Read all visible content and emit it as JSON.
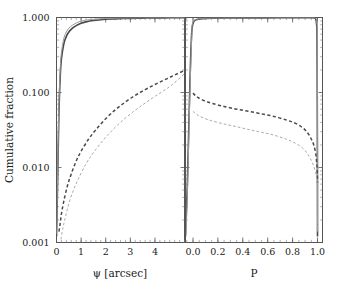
{
  "chart_data": {
    "type": "line",
    "title": "",
    "ylabel": "Cumulative fraction",
    "ylim": [
      0.001,
      1.0
    ],
    "yscale": "log",
    "ytick_labels": [
      "1.000",
      "0.100",
      "0.010",
      "0.001"
    ],
    "ytick_values": [
      1.0,
      0.1,
      0.01,
      0.001
    ],
    "grid": false,
    "legend": "none",
    "panels": [
      {
        "name": "left-panel",
        "xlabel": "ψ [arcsec]",
        "xlim": [
          0,
          5.2
        ],
        "xtick_labels": [
          "0",
          "1",
          "2",
          "3",
          "4"
        ],
        "xtick_values": [
          0,
          1,
          2,
          3,
          4
        ],
        "series": [
          {
            "name": "solid-dark",
            "style": "solid",
            "color": "#4a4a4a",
            "x": [
              0.0,
              0.03,
              0.06,
              0.1,
              0.15,
              0.2,
              0.3,
              0.4,
              0.5,
              0.65,
              0.8,
              1.0,
              1.2,
              1.5,
              1.8,
              2.2,
              2.6,
              3.0,
              3.5,
              4.0,
              4.6,
              5.2
            ],
            "y": [
              0.0012,
              0.0035,
              0.012,
              0.055,
              0.16,
              0.28,
              0.45,
              0.56,
              0.64,
              0.72,
              0.78,
              0.84,
              0.875,
              0.912,
              0.935,
              0.955,
              0.966,
              0.974,
              0.981,
              0.986,
              0.991,
              0.994
            ]
          },
          {
            "name": "solid-light",
            "style": "solid",
            "color": "#9a9a9a",
            "x": [
              0.0,
              0.03,
              0.06,
              0.1,
              0.15,
              0.2,
              0.3,
              0.4,
              0.5,
              0.65,
              0.8,
              1.0,
              1.2,
              1.5,
              1.8,
              2.2,
              2.6,
              3.0,
              3.5,
              4.0,
              4.6,
              5.2
            ],
            "y": [
              0.0013,
              0.0042,
              0.016,
              0.072,
              0.2,
              0.34,
              0.53,
              0.64,
              0.72,
              0.79,
              0.845,
              0.895,
              0.922,
              0.948,
              0.963,
              0.975,
              0.982,
              0.986,
              0.99,
              0.993,
              0.996,
              0.997
            ]
          },
          {
            "name": "dashed-dark",
            "style": "dashed",
            "color": "#4a4a4a",
            "x": [
              0.1,
              0.15,
              0.2,
              0.3,
              0.45,
              0.6,
              0.8,
              1.0,
              1.3,
              1.6,
              2.0,
              2.4,
              2.8,
              3.2,
              3.6,
              4.0,
              4.4,
              4.8,
              5.2
            ],
            "y": [
              0.0014,
              0.0018,
              0.0024,
              0.0036,
              0.0058,
              0.0082,
              0.0122,
              0.0165,
              0.0238,
              0.0318,
              0.0448,
              0.0592,
              0.0748,
              0.0915,
              0.109,
              0.128,
              0.148,
              0.171,
              0.197
            ]
          },
          {
            "name": "dashed-light",
            "style": "dashed",
            "color": "#a8a8a8",
            "x": [
              0.18,
              0.25,
              0.35,
              0.5,
              0.7,
              0.9,
              1.2,
              1.5,
              1.9,
              2.3,
              2.7,
              3.1,
              3.5,
              3.9,
              4.3,
              4.7,
              5.2
            ],
            "y": [
              0.0011,
              0.0015,
              0.0021,
              0.0033,
              0.0051,
              0.0072,
              0.0112,
              0.0158,
              0.0232,
              0.0322,
              0.0428,
              0.0548,
              0.0685,
              0.0845,
              0.103,
              0.127,
              0.178
            ]
          }
        ]
      },
      {
        "name": "right-panel",
        "xlabel": "P",
        "xlim": [
          -0.06,
          1.04
        ],
        "xtick_labels": [
          "0.0",
          "0.2",
          "0.4",
          "0.6",
          "0.8",
          "1.0"
        ],
        "xtick_values": [
          0.0,
          0.2,
          0.4,
          0.6,
          0.8,
          1.0
        ],
        "series": [
          {
            "name": "solid-dark",
            "style": "solid",
            "color": "#4a4a4a",
            "x": [
              -0.06,
              -0.045,
              -0.03,
              -0.015,
              0.0,
              0.05,
              0.15,
              0.3,
              0.5,
              0.7,
              0.85,
              0.93,
              0.96,
              0.975,
              0.985,
              0.992,
              0.996,
              0.999,
              1.0
            ],
            "y": [
              0.0012,
              0.006,
              0.06,
              0.42,
              0.83,
              0.952,
              0.976,
              0.984,
              0.988,
              0.991,
              0.993,
              0.994,
              0.992,
              0.985,
              0.955,
              0.82,
              0.5,
              0.02,
              0.0012
            ]
          },
          {
            "name": "solid-light",
            "style": "solid",
            "color": "#9a9a9a",
            "x": [
              -0.055,
              -0.04,
              -0.025,
              -0.01,
              0.0,
              0.05,
              0.15,
              0.3,
              0.5,
              0.7,
              0.85,
              0.93,
              0.965,
              0.98,
              0.99,
              0.995,
              0.998,
              1.0
            ],
            "y": [
              0.0013,
              0.009,
              0.09,
              0.54,
              0.87,
              0.962,
              0.981,
              0.988,
              0.991,
              0.994,
              0.996,
              0.997,
              0.996,
              0.99,
              0.96,
              0.85,
              0.45,
              0.0014
            ]
          },
          {
            "name": "dashed-dark",
            "style": "dashed",
            "color": "#4a4a4a",
            "x": [
              0.0,
              0.03,
              0.08,
              0.15,
              0.25,
              0.35,
              0.45,
              0.55,
              0.65,
              0.75,
              0.82,
              0.88,
              0.92,
              0.95,
              0.97,
              0.985,
              0.993,
              0.997,
              1.0
            ],
            "y": [
              0.098,
              0.088,
              0.079,
              0.072,
              0.065,
              0.06,
              0.056,
              0.052,
              0.048,
              0.043,
              0.039,
              0.034,
              0.029,
              0.024,
              0.02,
              0.0155,
              0.0118,
              0.0092,
              0.0062
            ]
          },
          {
            "name": "dashed-light",
            "style": "dashed",
            "color": "#a8a8a8",
            "x": [
              0.0,
              0.03,
              0.08,
              0.15,
              0.25,
              0.35,
              0.45,
              0.55,
              0.65,
              0.75,
              0.82,
              0.88,
              0.92,
              0.95,
              0.97,
              0.985,
              0.993,
              0.997,
              1.0
            ],
            "y": [
              0.056,
              0.051,
              0.046,
              0.042,
              0.038,
              0.035,
              0.032,
              0.0295,
              0.027,
              0.0238,
              0.0212,
              0.0182,
              0.0152,
              0.0125,
              0.0104,
              0.0085,
              0.0072,
              0.0064,
              0.0058
            ]
          }
        ]
      }
    ]
  },
  "axes": {
    "ylabel": "Cumulative fraction",
    "left_xlabel": "ψ [arcsec]",
    "right_xlabel": "P"
  },
  "colors": {
    "frame": "#555555",
    "dark_curve": "#4a4a4a",
    "light_curve": "#9a9a9a",
    "text": "#1a1a1a",
    "background": "#ffffff"
  }
}
